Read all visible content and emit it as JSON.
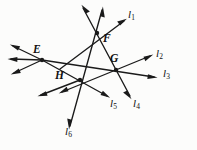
{
  "figure": {
    "width": 197,
    "height": 150,
    "background_color": "#fcfcfb",
    "ink_color": "#1a1a1a",
    "stroke_width": 1.35
  },
  "points": [
    {
      "id": "E",
      "label": "E",
      "x": 42,
      "y": 60,
      "label_x": 33,
      "label_y": 44
    },
    {
      "id": "F",
      "label": "F",
      "x": 97,
      "y": 33,
      "label_x": 103,
      "label_y": 33
    },
    {
      "id": "G",
      "label": "G",
      "x": 116,
      "y": 70,
      "label_x": 110,
      "label_y": 53
    },
    {
      "id": "H",
      "label": "H",
      "x": 80,
      "y": 80,
      "label_x": 55,
      "label_y": 70
    }
  ],
  "lines": [
    {
      "id": "l1",
      "label": "l",
      "subscript": "1",
      "label_x": 128,
      "label_y": 9,
      "through_points": [
        "E",
        "F"
      ],
      "from": {
        "x": 60,
        "y": 69
      },
      "to": {
        "x": 124,
        "y": 21
      },
      "arrow_at": "to"
    },
    {
      "id": "l2",
      "label": "l",
      "subscript": "2",
      "label_x": 156,
      "label_y": 48,
      "through_points": [
        "H",
        "G"
      ],
      "from": {
        "x": 62,
        "y": 92
      },
      "to": {
        "x": 150,
        "y": 56
      },
      "arrow_at": "both"
    },
    {
      "id": "l3",
      "label": "l",
      "subscript": "3",
      "label_x": 163,
      "label_y": 68,
      "through_points": [
        "E",
        "G"
      ],
      "from": {
        "x": 42,
        "y": 60
      },
      "to": {
        "x": 154,
        "y": 77
      },
      "arrow_at": "to"
    },
    {
      "id": "l4",
      "label": "l",
      "subscript": "4",
      "label_x": 133,
      "label_y": 98,
      "through_points": [
        "F",
        "G"
      ],
      "from": {
        "x": 83,
        "y": 8
      },
      "to": {
        "x": 130,
        "y": 96
      },
      "arrow_at": "both"
    },
    {
      "id": "l5",
      "label": "l",
      "subscript": "5",
      "label_x": 110,
      "label_y": 98,
      "through_points": [
        "E",
        "H"
      ],
      "from": {
        "x": 42,
        "y": 60
      },
      "to": {
        "x": 107,
        "y": 96
      },
      "arrow_at": "to"
    },
    {
      "id": "l6",
      "label": "l",
      "subscript": "6",
      "label_x": 65,
      "label_y": 126,
      "through_points": [
        "F",
        "H"
      ],
      "from": {
        "x": 102,
        "y": 10
      },
      "to": {
        "x": 70,
        "y": 126
      },
      "arrow_at": "both"
    }
  ],
  "extra_rays": [
    {
      "id": "E-upper-left",
      "from_point": "E",
      "to": {
        "x": 11,
        "y": 46
      },
      "arrow": true
    },
    {
      "id": "E-left",
      "from_point": "E",
      "to": {
        "x": 8,
        "y": 59
      },
      "arrow": true
    },
    {
      "id": "E-lower-left",
      "from_point": "E",
      "to": {
        "x": 12,
        "y": 73
      },
      "arrow": true
    },
    {
      "id": "H-lower-left",
      "from_point": "H",
      "to": {
        "x": 38,
        "y": 96
      },
      "arrow": true
    }
  ]
}
